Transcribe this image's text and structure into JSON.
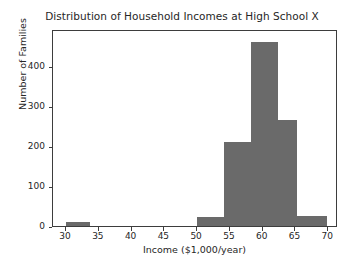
{
  "chart_data": {
    "type": "bar",
    "title": "Distribution of Household Incomes at High School X",
    "xlabel": "Income ($1,000/year)",
    "ylabel": "Number of Families",
    "grid": false,
    "legend": null,
    "xlim": [
      28,
      71.5
    ],
    "ylim": [
      0,
      492
    ],
    "xticks": [
      30,
      35,
      40,
      45,
      50,
      55,
      60,
      65,
      70
    ],
    "xtick_labels": [
      "30",
      "35",
      "40",
      "45",
      "50",
      "55",
      "60",
      "65",
      "70"
    ],
    "yticks": [
      0,
      100,
      200,
      300,
      400
    ],
    "ytick_labels": [
      "0",
      "100",
      "200",
      "300",
      "400"
    ],
    "bar_color": "#6a6a6a",
    "frame_color": "#3d3d3d",
    "background": "#ffffff",
    "bins": [
      {
        "label": "30-33.7",
        "x0": 30.0,
        "x1": 33.7,
        "value": 10
      },
      {
        "label": "50-54.1",
        "x0": 50.0,
        "x1": 54.1,
        "value": 22
      },
      {
        "label": "54.1-58.2",
        "x0": 54.1,
        "x1": 58.2,
        "value": 210
      },
      {
        "label": "58.2-62.3",
        "x0": 58.2,
        "x1": 62.3,
        "value": 460
      },
      {
        "label": "62.3-65.3",
        "x0": 62.3,
        "x1": 65.3,
        "value": 265
      },
      {
        "label": "65.3-69.8",
        "x0": 65.3,
        "x1": 69.8,
        "value": 25
      }
    ],
    "categories": [
      "30-33.7",
      "50-54.1",
      "54.1-58.2",
      "58.2-62.3",
      "62.3-65.3",
      "65.3-69.8"
    ],
    "values": [
      10,
      22,
      210,
      460,
      265,
      25
    ]
  }
}
